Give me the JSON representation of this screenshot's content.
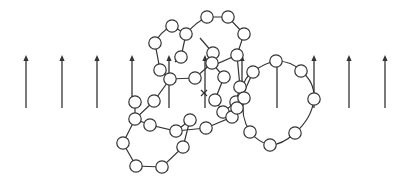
{
  "diagram": {
    "stroke_color": "#333333",
    "background": "#ffffff",
    "field_arrows": {
      "y_top": 55,
      "y_bottom": 108,
      "x_positions": [
        26,
        62,
        97,
        132,
        169,
        205,
        242,
        277,
        314,
        349,
        385
      ]
    },
    "center_mark": {
      "symbol": "x",
      "x": 204,
      "y": 93
    },
    "bead_radius": 6.2,
    "chains": [
      {
        "name": "upper-left-loop",
        "path": "M160,70 L155,43 Q160,32 172,26 L186,34 L181,57 L175,62",
        "beads": [
          [
            160,
            70
          ],
          [
            155,
            43
          ],
          [
            172,
            26
          ],
          [
            186,
            34
          ],
          [
            181,
            57
          ]
        ]
      },
      {
        "name": "upper-right-loop",
        "path": "M186,34 Q196,22 207,17 L228,17 L244,34 L237,55 L212,66 L213,53 L200,38",
        "beads": [
          [
            207,
            17
          ],
          [
            228,
            17
          ],
          [
            244,
            34
          ],
          [
            237,
            55
          ],
          [
            213,
            53
          ]
        ]
      },
      {
        "name": "central-chain",
        "path": "M160,70 L170,79 L195,78 L212,63 M212,63 L224,77 L215,100 L223,112 L236,102 L240,87 L237,55",
        "beads": [
          [
            170,
            79
          ],
          [
            195,
            78
          ],
          [
            212,
            63
          ],
          [
            224,
            77
          ],
          [
            215,
            100
          ],
          [
            223,
            112
          ],
          [
            236,
            102
          ],
          [
            240,
            87
          ]
        ]
      },
      {
        "name": "lower-left-loop",
        "path": "M170,79 L154,101 L135,119 L123,143 L136,166 L162,167 L183,147 L190,120 L176,131 L150,125 L135,119 M135,102 L135,119 M154,101 L170,79 M176,131 L206,128 L232,117 L237,108 L253,72",
        "beads": [
          [
            135,
            102
          ],
          [
            154,
            101
          ],
          [
            135,
            119
          ],
          [
            150,
            125
          ],
          [
            123,
            143
          ],
          [
            136,
            166
          ],
          [
            162,
            167
          ],
          [
            183,
            147
          ],
          [
            190,
            120
          ],
          [
            176,
            131
          ],
          [
            206,
            128
          ],
          [
            232,
            117
          ],
          [
            237,
            108
          ]
        ]
      },
      {
        "name": "right-loop",
        "path": "M244,98 Q240,80 253,72 Q264,63 276,61 Q292,61 301,71 Q315,82 314,99 Q312,118 295,133 Q282,145 270,145 Q258,142 250,132 Q240,116 244,98",
        "beads": [
          [
            276,
            61
          ],
          [
            253,
            72
          ],
          [
            301,
            71
          ],
          [
            314,
            99
          ],
          [
            295,
            133
          ],
          [
            270,
            145
          ],
          [
            250,
            132
          ],
          [
            244,
            98
          ]
        ]
      }
    ]
  }
}
